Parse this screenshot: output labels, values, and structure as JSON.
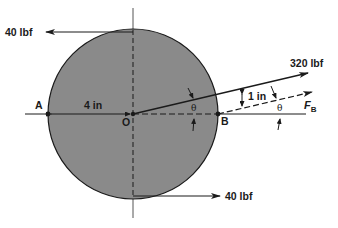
{
  "diagram": {
    "type": "free-body diagram",
    "colors": {
      "disk_fill": "#8a8a8a",
      "line": "#1a1a1a",
      "axis": "#555555",
      "background": "#ffffff"
    },
    "points": {
      "A": "A",
      "O": "O",
      "B": "B"
    },
    "forces": {
      "top": {
        "label": "40 lbf",
        "direction": "left"
      },
      "bottom": {
        "label": "40 lbf",
        "direction": "right"
      },
      "applied": {
        "label": "320 lbf",
        "direction": "up-right at angle θ"
      },
      "reaction": {
        "label": "F",
        "subscript": "B",
        "direction": "up-right at angle θ (dashed)"
      }
    },
    "dimensions": {
      "radius": "4 in",
      "offset": "1 in"
    },
    "angles": {
      "theta_symbol": "θ"
    }
  }
}
